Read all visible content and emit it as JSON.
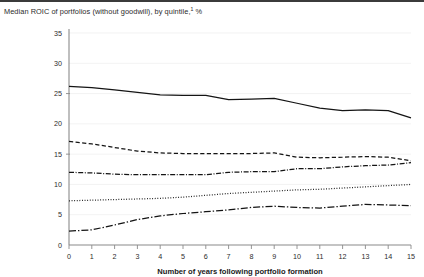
{
  "title": {
    "text": "Median ROIC of portfolios (without goodwill), by quintile,",
    "footnote_marker": "1",
    "unit": " %"
  },
  "chart_data": {
    "type": "line",
    "title": "Median ROIC of portfolios (without goodwill), by quintile,1 %",
    "xlabel": "Number of years following portfolio formation",
    "ylabel": "",
    "xlim": [
      0,
      15
    ],
    "ylim": [
      0,
      35
    ],
    "grid": true,
    "legend_position": "none",
    "x": [
      0,
      1,
      2,
      3,
      4,
      5,
      6,
      7,
      8,
      9,
      10,
      11,
      12,
      13,
      14,
      15
    ],
    "xticks": [
      "0",
      "1",
      "2",
      "3",
      "4",
      "5",
      "6",
      "7",
      "8",
      "9",
      "10",
      "11",
      "12",
      "13",
      "14",
      "15"
    ],
    "yticks": [
      "0",
      "5",
      "10",
      "15",
      "20",
      "25",
      "30",
      "35"
    ],
    "series": [
      {
        "name": "Top quintile",
        "style": "solid",
        "values": [
          26.2,
          26.0,
          25.6,
          25.2,
          24.8,
          24.7,
          24.7,
          24.0,
          24.1,
          24.2,
          23.4,
          22.6,
          22.2,
          22.3,
          22.2,
          21.0
        ]
      },
      {
        "name": "Second quintile",
        "style": "dashed",
        "values": [
          17.1,
          16.7,
          16.1,
          15.5,
          15.2,
          15.1,
          15.1,
          15.1,
          15.1,
          15.2,
          14.5,
          14.4,
          14.5,
          14.6,
          14.5,
          13.9
        ]
      },
      {
        "name": "Third quintile",
        "style": "dash-dot",
        "values": [
          12.0,
          11.9,
          11.7,
          11.6,
          11.6,
          11.6,
          11.6,
          12.0,
          12.1,
          12.1,
          12.6,
          12.6,
          12.9,
          13.1,
          13.2,
          13.6
        ]
      },
      {
        "name": "Fourth quintile",
        "style": "dotted",
        "values": [
          7.3,
          7.4,
          7.5,
          7.6,
          7.7,
          7.9,
          8.2,
          8.5,
          8.7,
          8.9,
          9.1,
          9.2,
          9.4,
          9.6,
          9.8,
          10.0
        ]
      },
      {
        "name": "Bottom quintile",
        "style": "dash-dot-long",
        "values": [
          2.3,
          2.5,
          3.3,
          4.2,
          4.8,
          5.2,
          5.5,
          5.8,
          6.2,
          6.4,
          6.2,
          6.1,
          6.4,
          6.7,
          6.6,
          6.5
        ]
      }
    ]
  }
}
